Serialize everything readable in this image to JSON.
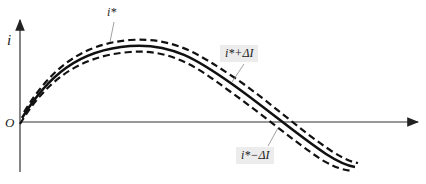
{
  "diagram": {
    "type": "current hysteresis band diagram",
    "axes": {
      "y_label": "i",
      "origin_label": "O"
    },
    "curves": [
      {
        "name": "reference current",
        "style": "solid",
        "label": "i*"
      },
      {
        "name": "upper band",
        "style": "dashed",
        "label": "i*+ΔI"
      },
      {
        "name": "lower band",
        "style": "dashed",
        "label": "i*−ΔI"
      }
    ],
    "labels": {
      "ref": "i*",
      "upper": "i*+ΔI",
      "lower": "i*−ΔI"
    },
    "colors": {
      "curve": "#111111",
      "axis": "#333333",
      "label_box": "#ececec",
      "leader": "#888888"
    }
  }
}
